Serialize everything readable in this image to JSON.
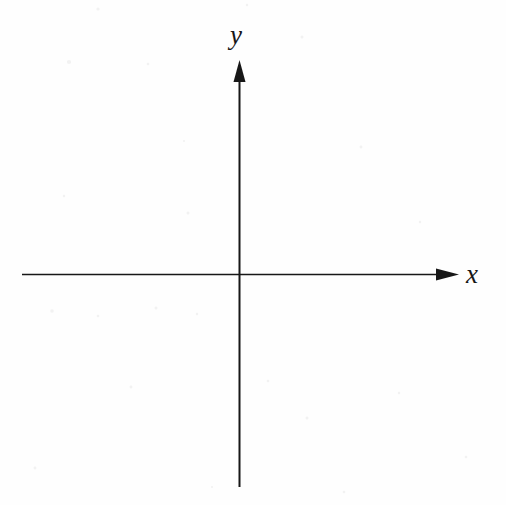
{
  "figure": {
    "kind": "cartesian-coordinate-axes",
    "width": 506,
    "height": 505,
    "background_color": "#fefefe",
    "ink_color": "#171717"
  },
  "labels": {
    "y_axis": "y",
    "x_axis": "x"
  },
  "chart_data": {
    "type": "line",
    "title": "",
    "subtitle": "",
    "xlabel": "x",
    "ylabel": "y",
    "grid": false,
    "legend": null,
    "series": [],
    "categories": [],
    "values": [],
    "annotations": [],
    "axes": {
      "origin_px": [
        240,
        274
      ],
      "x_axis": {
        "label": "x",
        "orientation": "horizontal",
        "start_px": [
          22,
          274
        ],
        "end_px": [
          459,
          274
        ],
        "arrow_at": "positive-end",
        "ticks": [],
        "tick_labels": [],
        "xlim": null
      },
      "y_axis": {
        "label": "y",
        "orientation": "vertical",
        "start_px": [
          240,
          487
        ],
        "end_px": [
          240,
          60
        ],
        "arrow_at": "positive-end",
        "ticks": [],
        "tick_labels": [],
        "ylim": null
      }
    }
  }
}
